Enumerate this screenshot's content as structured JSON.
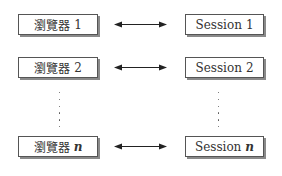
{
  "diagram": {
    "rows": [
      {
        "browser_label": "瀏覽器",
        "browser_suffix": "1",
        "session_label": "Session",
        "session_suffix": "1",
        "connector": "bidirectional-arrow"
      },
      {
        "browser_label": "瀏覽器",
        "browser_suffix": "2",
        "session_label": "Session",
        "session_suffix": "2",
        "connector": "bidirectional-arrow"
      },
      {
        "browser_label": "瀏覽器",
        "browser_suffix": "n",
        "session_label": "Session",
        "session_suffix": "n",
        "connector": "bidirectional-arrow"
      }
    ],
    "ellipsis": "vertical-dots",
    "colors": {
      "border": "#555555",
      "shadow": "#8a8a8a",
      "text": "#333333",
      "arrow": "#222222"
    }
  }
}
